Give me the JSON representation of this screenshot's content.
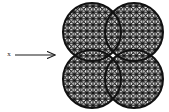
{
  "figure": {
    "caption": "",
    "background_color": "#ffffff",
    "line_color": "#111111",
    "canvas": {
      "width": 169,
      "height": 112
    }
  },
  "axis_label": {
    "text": "x",
    "x": 9,
    "y": 54,
    "font_size": 7,
    "color": "#1a1a1a"
  },
  "arrow": {
    "name": "x-direction-arrow",
    "start_x": 15,
    "start_y": 55,
    "end_x": 64,
    "end_y": 55,
    "head_length": 9,
    "head_half_width": 4,
    "stroke_width": 1.1,
    "color": "#1a1a1a"
  },
  "cluster": {
    "name": "four-overlapping-spheres",
    "count": 4,
    "radius": 29,
    "fill_color": "#ffffff",
    "outline_color": "#111111",
    "outline_width": 2.0,
    "hatch_color": "#111111",
    "hatch_spacing": 6.2,
    "hatch_width": 1.15,
    "circles": [
      {
        "label": "top-left",
        "cx": 92,
        "cy": 32
      },
      {
        "label": "top-right",
        "cx": 134,
        "cy": 32
      },
      {
        "label": "bottom-left",
        "cx": 92,
        "cy": 79
      },
      {
        "label": "bottom-right",
        "cx": 134,
        "cy": 79
      }
    ]
  }
}
